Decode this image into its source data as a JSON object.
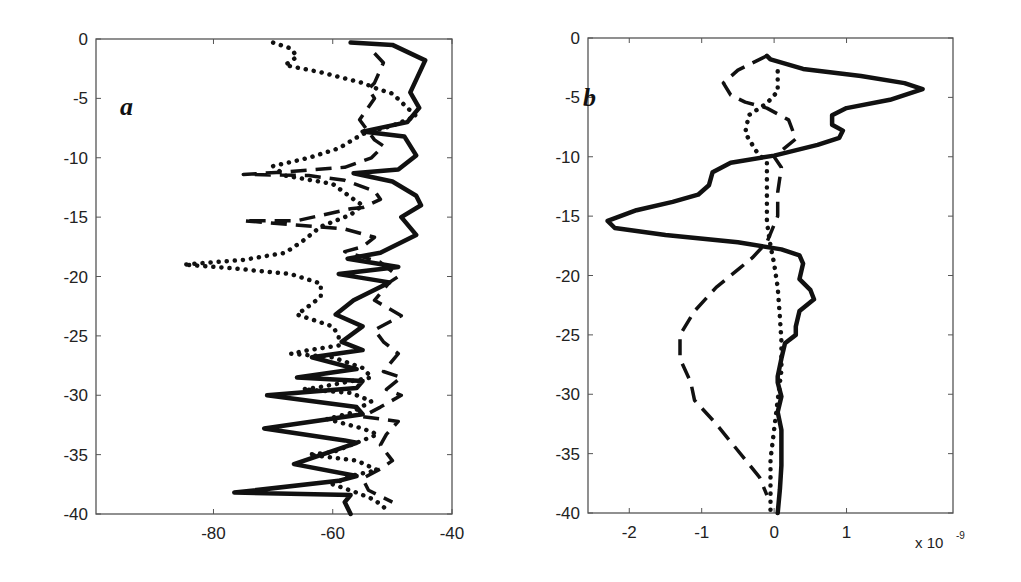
{
  "figure": {
    "panels": [
      "a",
      "b"
    ]
  },
  "chart_data": [
    {
      "type": "line",
      "panel_label": "a",
      "title": "",
      "xlabel": "",
      "ylabel": "",
      "xlim": [
        -99.7,
        -40
      ],
      "ylim": [
        -40,
        0
      ],
      "xticks": [
        -80,
        -60,
        -40
      ],
      "xtick_labels": [
        "-80",
        "-60",
        "-40"
      ],
      "yticks": [
        0,
        -5,
        -10,
        -15,
        -20,
        -25,
        -30,
        -35,
        -40
      ],
      "ytick_labels": [
        "0",
        "-5",
        "-10",
        "-15",
        "-20",
        "-25",
        "-30",
        "-35",
        "-40"
      ],
      "grid": false,
      "legend": null,
      "series": [
        {
          "name": "solid",
          "style": "solid",
          "points": [
            [
              -57,
              -0.3
            ],
            [
              -50,
              -0.5
            ],
            [
              -44.5,
              -1.8
            ],
            [
              -47,
              -4.5
            ],
            [
              -45.5,
              -5.8
            ],
            [
              -47.5,
              -7
            ],
            [
              -55,
              -7.8
            ],
            [
              -48,
              -8.2
            ],
            [
              -46,
              -9.8
            ],
            [
              -49,
              -11
            ],
            [
              -56.5,
              -11.3
            ],
            [
              -50,
              -12
            ],
            [
              -46,
              -13.2
            ],
            [
              -45.2,
              -14
            ],
            [
              -48.5,
              -15
            ],
            [
              -46,
              -16.5
            ],
            [
              -52,
              -18
            ],
            [
              -57.5,
              -18.5
            ],
            [
              -49,
              -19.2
            ],
            [
              -59,
              -19.8
            ],
            [
              -50.5,
              -20.5
            ],
            [
              -56.5,
              -22
            ],
            [
              -59.5,
              -23.2
            ],
            [
              -55,
              -24.2
            ],
            [
              -58.5,
              -25.5
            ],
            [
              -55,
              -26.2
            ],
            [
              -63.5,
              -26.8
            ],
            [
              -56,
              -27.8
            ],
            [
              -66,
              -28.5
            ],
            [
              -55,
              -28.8
            ],
            [
              -56,
              -29.4
            ],
            [
              -71,
              -30
            ],
            [
              -56,
              -31
            ],
            [
              -55,
              -31.6
            ],
            [
              -71.5,
              -32.8
            ],
            [
              -58,
              -33.8
            ],
            [
              -56,
              -34
            ],
            [
              -66.5,
              -35.8
            ],
            [
              -56,
              -36.8
            ],
            [
              -59,
              -37.2
            ],
            [
              -76.5,
              -38.2
            ],
            [
              -57,
              -38.4
            ],
            [
              -58,
              -39
            ],
            [
              -57,
              -40
            ]
          ]
        },
        {
          "name": "dashed",
          "style": "dashed",
          "points": [
            [
              -53,
              -1.2
            ],
            [
              -51.5,
              -2
            ],
            [
              -53,
              -3.7
            ],
            [
              -54,
              -4.2
            ],
            [
              -53,
              -5
            ],
            [
              -55.5,
              -6.8
            ],
            [
              -53,
              -8.5
            ],
            [
              -51.5,
              -9
            ],
            [
              -53.5,
              -10
            ],
            [
              -58,
              -10.8
            ],
            [
              -68,
              -11.2
            ],
            [
              -75,
              -11.4
            ],
            [
              -64,
              -11.5
            ],
            [
              -58,
              -11.9
            ],
            [
              -53,
              -12.8
            ],
            [
              -52,
              -13.5
            ],
            [
              -55,
              -14.2
            ],
            [
              -57,
              -14.3
            ],
            [
              -66,
              -15.3
            ],
            [
              -75,
              -15.3
            ],
            [
              -58,
              -16
            ],
            [
              -53,
              -16.7
            ],
            [
              -55,
              -17.5
            ],
            [
              -58,
              -17.9
            ],
            [
              -52,
              -18.8
            ],
            [
              -49,
              -20
            ],
            [
              -50.5,
              -20.5
            ],
            [
              -53,
              -22
            ],
            [
              -48.5,
              -23.3
            ],
            [
              -53,
              -24.5
            ],
            [
              -51.5,
              -25.5
            ],
            [
              -49,
              -26.5
            ],
            [
              -51.5,
              -28
            ],
            [
              -48.5,
              -28.5
            ],
            [
              -51,
              -29.5
            ],
            [
              -48.5,
              -30
            ],
            [
              -52,
              -31
            ],
            [
              -55,
              -31.8
            ],
            [
              -49,
              -32.2
            ],
            [
              -51,
              -33.3
            ],
            [
              -52,
              -34.2
            ],
            [
              -50,
              -35.5
            ],
            [
              -52,
              -36.2
            ],
            [
              -55,
              -37
            ],
            [
              -54,
              -38
            ],
            [
              -50,
              -39
            ]
          ]
        },
        {
          "name": "dotted",
          "style": "dotted",
          "points": [
            [
              -70,
              -0.3
            ],
            [
              -67,
              -0.8
            ],
            [
              -66,
              -1.5
            ],
            [
              -68,
              -2.2
            ],
            [
              -62,
              -2.8
            ],
            [
              -55,
              -3.7
            ],
            [
              -52.5,
              -4.2
            ],
            [
              -50,
              -4.6
            ],
            [
              -46,
              -6.5
            ],
            [
              -50,
              -7.3
            ],
            [
              -55,
              -8
            ],
            [
              -59,
              -9.2
            ],
            [
              -64,
              -10
            ],
            [
              -70,
              -10.7
            ],
            [
              -68,
              -11.5
            ],
            [
              -60,
              -12.2
            ],
            [
              -56.5,
              -13.5
            ],
            [
              -55,
              -14
            ],
            [
              -57,
              -14.8
            ],
            [
              -62,
              -15.8
            ],
            [
              -65,
              -17
            ],
            [
              -68,
              -18
            ],
            [
              -75,
              -18.6
            ],
            [
              -85,
              -19
            ],
            [
              -77,
              -19.3
            ],
            [
              -67,
              -19.8
            ],
            [
              -62,
              -20.6
            ],
            [
              -62,
              -21.7
            ],
            [
              -63.5,
              -22.3
            ],
            [
              -66,
              -23.2
            ],
            [
              -60,
              -24.2
            ],
            [
              -59,
              -25
            ],
            [
              -59,
              -25.8
            ],
            [
              -64,
              -26.2
            ],
            [
              -67,
              -26.5
            ],
            [
              -60,
              -26.8
            ],
            [
              -55,
              -27.7
            ],
            [
              -53.5,
              -28.5
            ],
            [
              -62,
              -29.3
            ],
            [
              -65,
              -29.5
            ],
            [
              -57,
              -29.8
            ],
            [
              -53.5,
              -30.5
            ],
            [
              -57,
              -31.5
            ],
            [
              -61,
              -32
            ],
            [
              -55,
              -32.8
            ],
            [
              -52.5,
              -33.3
            ],
            [
              -55,
              -33.8
            ],
            [
              -60,
              -34.8
            ],
            [
              -64,
              -35
            ],
            [
              -56,
              -35.5
            ],
            [
              -52.5,
              -36.3
            ],
            [
              -57,
              -36.8
            ],
            [
              -60,
              -37.5
            ],
            [
              -56,
              -38.2
            ],
            [
              -53,
              -38.8
            ],
            [
              -51,
              -39.6
            ]
          ]
        }
      ]
    },
    {
      "type": "line",
      "panel_label": "b",
      "title": "",
      "xlabel": "",
      "ylabel": "",
      "x_multiplier_label": "x 10",
      "x_multiplier_exponent": "-9",
      "xlim": [
        -2.57,
        2.47
      ],
      "ylim": [
        -40,
        0
      ],
      "xticks": [
        -2,
        -1,
        0,
        1
      ],
      "xtick_labels": [
        "-2",
        "-1",
        "0",
        "1"
      ],
      "yticks": [
        0,
        -5,
        -10,
        -15,
        -20,
        -25,
        -30,
        -35,
        -40
      ],
      "ytick_labels": [
        "0",
        "-5",
        "-10",
        "-15",
        "-20",
        "-25",
        "-30",
        "-35",
        "-40"
      ],
      "grid": false,
      "legend": null,
      "series": [
        {
          "name": "solid",
          "style": "solid",
          "points": [
            [
              -0.1,
              -1.5
            ],
            [
              -0.05,
              -1.8
            ],
            [
              0.4,
              -2.6
            ],
            [
              1.2,
              -3.2
            ],
            [
              1.8,
              -3.8
            ],
            [
              2.05,
              -4.3
            ],
            [
              1.6,
              -5.2
            ],
            [
              1.0,
              -5.9
            ],
            [
              0.8,
              -6.5
            ],
            [
              0.8,
              -7.3
            ],
            [
              0.95,
              -7.8
            ],
            [
              0.9,
              -8.4
            ],
            [
              0.6,
              -9.0
            ],
            [
              0.0,
              -9.9
            ],
            [
              -0.6,
              -10.5
            ],
            [
              -0.85,
              -11.3
            ],
            [
              -0.9,
              -12.4
            ],
            [
              -1.05,
              -13.2
            ],
            [
              -1.4,
              -13.8
            ],
            [
              -1.9,
              -14.5
            ],
            [
              -2.3,
              -15.4
            ],
            [
              -2.2,
              -16
            ],
            [
              -1.5,
              -16.6
            ],
            [
              -0.5,
              -17.2
            ],
            [
              0.1,
              -17.8
            ],
            [
              0.35,
              -18.3
            ],
            [
              0.4,
              -19
            ],
            [
              0.35,
              -20.3
            ],
            [
              0.5,
              -21.2
            ],
            [
              0.55,
              -22
            ],
            [
              0.35,
              -23
            ],
            [
              0.3,
              -24.3
            ],
            [
              0.3,
              -25
            ],
            [
              0.15,
              -25.7
            ],
            [
              0.1,
              -27
            ],
            [
              0.05,
              -28.5
            ],
            [
              0.05,
              -29
            ],
            [
              0.1,
              -30.2
            ],
            [
              0.05,
              -31.5
            ],
            [
              0.1,
              -33
            ],
            [
              0.1,
              -36
            ],
            [
              0.08,
              -38
            ],
            [
              0.05,
              -40
            ]
          ]
        },
        {
          "name": "dashed",
          "style": "dashed",
          "points": [
            [
              -0.1,
              -1.5
            ],
            [
              -0.5,
              -2.7
            ],
            [
              -0.7,
              -3.8
            ],
            [
              -0.6,
              -4.8
            ],
            [
              -0.4,
              -5.4
            ],
            [
              -0.1,
              -5.9
            ],
            [
              0.2,
              -6.9
            ],
            [
              0.3,
              -8.5
            ],
            [
              0.0,
              -10.0
            ],
            [
              0.1,
              -10.9
            ],
            [
              0.05,
              -13.0
            ],
            [
              0.05,
              -15.0
            ],
            [
              -0.1,
              -17.2
            ],
            [
              -0.3,
              -18.5
            ],
            [
              -0.5,
              -19.5
            ],
            [
              -0.8,
              -21.0
            ],
            [
              -1.1,
              -23.0
            ],
            [
              -1.3,
              -25.0
            ],
            [
              -1.3,
              -27.0
            ],
            [
              -1.15,
              -29.0
            ],
            [
              -1.1,
              -30.5
            ],
            [
              -0.8,
              -32.5
            ],
            [
              -0.6,
              -34.0
            ],
            [
              -0.4,
              -35.5
            ],
            [
              -0.2,
              -37.0
            ],
            [
              -0.1,
              -38.5
            ]
          ]
        },
        {
          "name": "dotted",
          "style": "dotted",
          "points": [
            [
              0.05,
              -2.8
            ],
            [
              0.05,
              -4.5
            ],
            [
              -0.1,
              -5.5
            ],
            [
              -0.35,
              -6.5
            ],
            [
              -0.4,
              -8.0
            ],
            [
              -0.25,
              -9.5
            ],
            [
              -0.1,
              -10.5
            ],
            [
              -0.1,
              -13.0
            ],
            [
              -0.1,
              -15.5
            ],
            [
              -0.05,
              -17.5
            ],
            [
              0.0,
              -19.0
            ],
            [
              0.05,
              -21.0
            ],
            [
              0.08,
              -23.5
            ],
            [
              0.1,
              -25.5
            ],
            [
              0.1,
              -28.0
            ],
            [
              0.05,
              -30.5
            ],
            [
              0.0,
              -33.0
            ],
            [
              -0.05,
              -35.5
            ],
            [
              -0.05,
              -38.0
            ],
            [
              -0.05,
              -40.0
            ]
          ]
        }
      ]
    }
  ],
  "layout": {
    "panels": [
      {
        "box": [
          96,
          39,
          452,
          514
        ]
      },
      {
        "box": [
          588,
          38,
          953,
          513
        ]
      }
    ],
    "panel_label_pos": [
      [
        120,
        115
      ],
      [
        583,
        106
      ]
    ]
  }
}
